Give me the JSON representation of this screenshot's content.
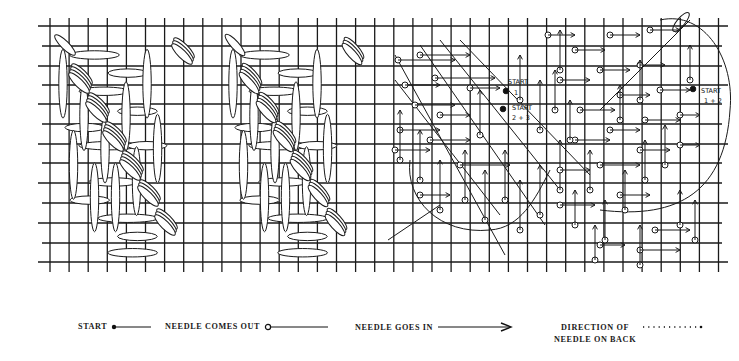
{
  "diagram": {
    "panels": [
      {
        "id": "panel-1",
        "description": "Completed diagonal leaf stitch pattern (variant A)"
      },
      {
        "id": "panel-2",
        "description": "Completed diagonal leaf stitch pattern (variant B)"
      },
      {
        "id": "panel-3",
        "description": "Working diagram with needle paths",
        "annotations": [
          "START",
          "1",
          "START",
          "2 + 3"
        ]
      },
      {
        "id": "panel-4",
        "description": "Working diagram with needle paths (circled region)",
        "annotations": [
          "START",
          "1 + 2"
        ]
      }
    ],
    "grid": {
      "columns": 36,
      "rows": 12,
      "line_color": "#1a1a1a"
    }
  },
  "annotations": {
    "start_1_label": "START",
    "start_1_num": "1",
    "start_23_label": "START",
    "start_23_num": "2 + 3",
    "start_12_label": "START",
    "start_12_num": "1 + 2"
  },
  "legend": {
    "items": [
      {
        "label": "START",
        "symbol": "filled-dot-line"
      },
      {
        "label": "NEEDLE COMES OUT",
        "symbol": "open-circle-line"
      },
      {
        "label": "NEEDLE GOES IN",
        "symbol": "arrow-line"
      },
      {
        "label_line1": "DIRECTION OF",
        "label_line2": "NEEDLE ON BACK",
        "symbol": "dotted-line"
      }
    ]
  }
}
